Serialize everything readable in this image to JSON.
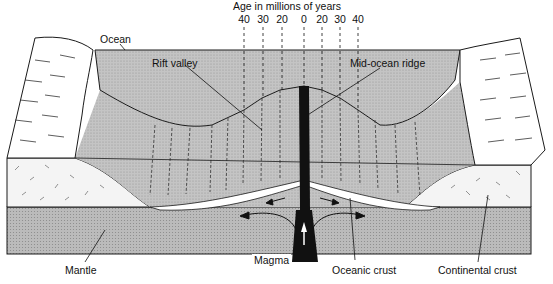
{
  "title": "Age in millions of years",
  "age_ticks": [
    {
      "label": "40",
      "x": 244
    },
    {
      "label": "30",
      "x": 263
    },
    {
      "label": "20",
      "x": 282
    },
    {
      "label": "0",
      "x": 304
    },
    {
      "label": "20",
      "x": 322
    },
    {
      "label": "30",
      "x": 340
    },
    {
      "label": "40",
      "x": 358
    }
  ],
  "labels": {
    "ocean": "Ocean",
    "rift_valley": "Rift valley",
    "mid_ocean_ridge": "Mid-ocean ridge",
    "magma": "Magma",
    "mantle": "Mantle",
    "oceanic_crust": "Oceanic crust",
    "continental_crust": "Continental crust"
  },
  "colors": {
    "ocean_water": "#c9c9c9",
    "mantle": "#bdbdbd",
    "crust_white": "#ffffff",
    "outline": "#1a1a1a",
    "magma": "#111111"
  }
}
